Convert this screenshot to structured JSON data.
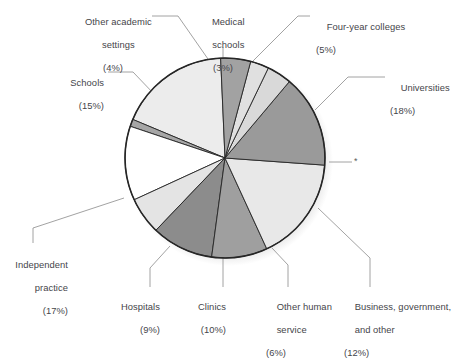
{
  "chart_data": {
    "type": "pie",
    "title": "",
    "subtitle": "",
    "xlabel": "",
    "ylabel": "",
    "legend_position": "callout-labels",
    "grid": false,
    "units": "percent",
    "total": 100,
    "note_marker": "*",
    "categories": [
      "Universities",
      "Business, government, and other",
      "Other human service",
      "Clinics",
      "Hospitals",
      "Independent practice",
      "Schools",
      "Other academic settings",
      "Medical schools",
      "Four-year colleges"
    ],
    "values": [
      18,
      12,
      6,
      10,
      9,
      17,
      15,
      4,
      3,
      5
    ],
    "slices": [
      {
        "name": "Universities",
        "label": "Universities",
        "percent": 18,
        "percent_text": "(18%)",
        "color": "#ececec",
        "start_angle": 92.5,
        "end_angle": 157.3,
        "label_side": "right",
        "has_marker": false
      },
      {
        "name": "asterisk-sliver",
        "label": "",
        "percent": 1,
        "percent_text": "",
        "color": "#a6a6a6",
        "start_angle": 157.3,
        "end_angle": 161.5,
        "label_side": "right",
        "has_marker": true,
        "marker": "*"
      },
      {
        "name": "Business, government, and other",
        "label": "Business, government,\nand other",
        "percent": 12,
        "percent_text": "(12%)",
        "color": "#ffffff",
        "start_angle": 161.5,
        "end_angle": 204.7,
        "label_side": "bottom",
        "has_marker": false
      },
      {
        "name": "Other human service",
        "label": "Other human\nservice",
        "percent": 6,
        "percent_text": "(6%)",
        "color": "#e4e4e4",
        "start_angle": 204.7,
        "end_angle": 226.3,
        "label_side": "bottom",
        "has_marker": false
      },
      {
        "name": "Clinics",
        "label": "Clinics",
        "percent": 10,
        "percent_text": "(10%)",
        "color": "#8c8c8c",
        "start_angle": 226.3,
        "end_angle": 262.3,
        "label_side": "bottom",
        "has_marker": false
      },
      {
        "name": "Hospitals",
        "label": "Hospitals",
        "percent": 9,
        "percent_text": "(9%)",
        "color": "#9f9f9f",
        "start_angle": 262.3,
        "end_angle": 294.7,
        "label_side": "bottom",
        "has_marker": false
      },
      {
        "name": "Independent practice",
        "label": "Independent\npractice",
        "percent": 17,
        "percent_text": "(17%)",
        "color": "#e8e8e8",
        "start_angle": 294.7,
        "end_angle": 355.9,
        "label_side": "left",
        "has_marker": false
      },
      {
        "name": "Schools",
        "label": "Schools",
        "percent": 15,
        "percent_text": "(15%)",
        "color": "#9a9a9a",
        "start_angle": 355.9,
        "end_angle": 49.9,
        "label_side": "left",
        "has_marker": false
      },
      {
        "name": "Other academic settings",
        "label": "Other academic\nsettings",
        "percent": 4,
        "percent_text": "(4%)",
        "color": "#d9d9d9",
        "start_angle": 49.9,
        "end_angle": 64.3,
        "label_side": "top",
        "has_marker": false
      },
      {
        "name": "Medical schools",
        "label": "Medical\nschools",
        "percent": 3,
        "percent_text": "(3%)",
        "color": "#e0e0e0",
        "start_angle": 64.3,
        "end_angle": 75.1,
        "label_side": "top",
        "has_marker": false
      },
      {
        "name": "Four-year colleges",
        "label": "Four-year colleges",
        "percent": 5,
        "percent_text": "(5%)",
        "color": "#a2a2a2",
        "start_angle": 75.1,
        "end_angle": 92.5,
        "label_side": "top",
        "has_marker": false
      }
    ]
  },
  "labels": {
    "other_academic_settings": {
      "line1": "Other academic",
      "line2": "settings",
      "pct": "(4%)"
    },
    "medical_schools": {
      "line1": "Medical",
      "line2": "schools",
      "pct": "(3%)"
    },
    "four_year_colleges": {
      "line1": "Four-year colleges",
      "pct": "(5%)"
    },
    "universities": {
      "line1": "Universities",
      "pct": "(18%)"
    },
    "schools": {
      "line1": "Schools",
      "pct": "(15%)"
    },
    "independent_practice": {
      "line1": "Independent",
      "line2": "practice",
      "pct": "(17%)"
    },
    "hospitals": {
      "line1": "Hospitals",
      "pct": "(9%)"
    },
    "clinics": {
      "line1": "Clinics",
      "pct": "(10%)"
    },
    "other_human_service": {
      "line1": "Other human",
      "line2": "service",
      "pct": "(6%)"
    },
    "business_government_other": {
      "line1": "Business, government,",
      "line2": "and other",
      "pct": "(12%)"
    },
    "marker": {
      "symbol": "*"
    }
  },
  "style": {
    "outline_color": "#262626",
    "leader_color": "#8a8a8a",
    "text_color": "#45454a",
    "background": "#ffffff",
    "shadow_color": "#cfcfcf"
  }
}
